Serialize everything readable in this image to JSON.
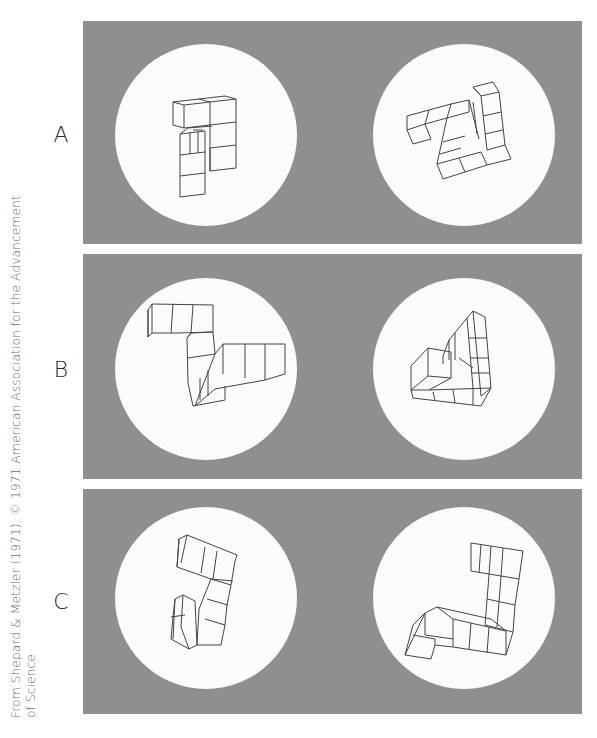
{
  "figure": {
    "caption_line1": "From Shepard & Metzler (1971). © 1971 American Association for the Advancement",
    "caption_line2": "of Science",
    "panel_color": "#8f8f8f",
    "circle_color": "#fbfbfb",
    "rows": [
      {
        "label": "A",
        "left_figure": "cube-object-a-left",
        "right_figure": "cube-object-a-right"
      },
      {
        "label": "B",
        "left_figure": "cube-object-b-left",
        "right_figure": "cube-object-b-right"
      },
      {
        "label": "C",
        "left_figure": "cube-object-c-left",
        "right_figure": "cube-object-c-right"
      }
    ]
  }
}
